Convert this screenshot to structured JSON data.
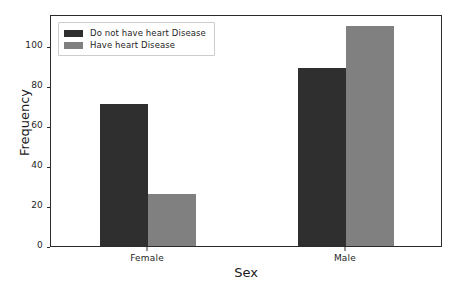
{
  "chart_data": {
    "type": "bar",
    "title": "",
    "xlabel": "Sex",
    "ylabel": "Frequency",
    "categories": [
      "Female",
      "Male"
    ],
    "series": [
      {
        "name": "Do not have heart Disease",
        "color": "#2f2f2f",
        "values": [
          71,
          89
        ]
      },
      {
        "name": "Have heart Disease",
        "color": "#808080",
        "values": [
          26,
          110
        ]
      }
    ],
    "ylim": [
      0,
      116
    ],
    "yticks": [
      0,
      20,
      40,
      60,
      80,
      100
    ],
    "ytick_labels": [
      "0",
      "20",
      "40",
      "60",
      "80",
      "100"
    ],
    "grid": false,
    "legend_position": "upper left",
    "bar_width_px": 48,
    "background": "#ffffff",
    "axis_color": "#2b2b2b"
  }
}
